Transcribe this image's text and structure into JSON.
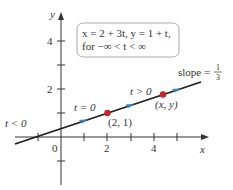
{
  "equation_box": {
    "line1": "x = 2 + 3t, y = 1 + t,",
    "line2": "for −∞ < t < ∞"
  },
  "axes": {
    "x_label": "x",
    "y_label": "y",
    "origin_label": "0",
    "x_ticks": [
      "2",
      "4"
    ],
    "y_ticks": [
      "2",
      "4"
    ]
  },
  "annotations": {
    "t_less": "t < 0",
    "t_zero": "t = 0",
    "t_greater": "t > 0",
    "point_21": "(2, 1)",
    "point_xy": "(x, y)",
    "slope_text": "slope = ",
    "slope_num": "1",
    "slope_den": "3"
  },
  "colors": {
    "line": "#1a1a1a",
    "red_point": "#c0282d",
    "blue_arrow": "#3a7fc1",
    "box_border": "#999999"
  }
}
